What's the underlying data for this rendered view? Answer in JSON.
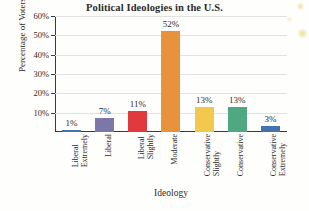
{
  "chart_data": {
    "type": "bar",
    "title": "Political Ideologies in the U.S.",
    "xlabel": "Ideology",
    "ylabel": "Percentage of Voters",
    "ylim": [
      0,
      60
    ],
    "y_tick_labels": [
      "10%",
      "20%",
      "30%",
      "40%",
      "50%",
      "60%"
    ],
    "y_ticks": [
      10,
      20,
      30,
      40,
      50,
      60
    ],
    "grid": "horizontal",
    "legend": "none",
    "categories": [
      "Extremely Liberal",
      "Liberal",
      "Slightly Liberal",
      "Moderate",
      "Slightly Conservative",
      "Conservative",
      "Extremely Conservative"
    ],
    "category_lines": [
      [
        "Extremely",
        "Liberal"
      ],
      [
        "Liberal"
      ],
      [
        "Slightly",
        "Liberal"
      ],
      [
        "Moderate"
      ],
      [
        "Slightly",
        "Conservative"
      ],
      [
        "Conservative"
      ],
      [
        "Extremely",
        "Conservative"
      ]
    ],
    "values": [
      1,
      7,
      11,
      52,
      13,
      13,
      3
    ],
    "value_labels": [
      "1%",
      "7%",
      "11%",
      "52%",
      "13%",
      "13%",
      "3%"
    ],
    "bar_colors": [
      "#4472b0",
      "#7b77a8",
      "#e0393e",
      "#e8923c",
      "#f2c94c",
      "#4fa882",
      "#4472b0"
    ]
  },
  "colors": {
    "axis": "#3a3a3a",
    "gridline": "#e2e2e2",
    "text": "#2b2b2b",
    "background": "#fefefd"
  }
}
